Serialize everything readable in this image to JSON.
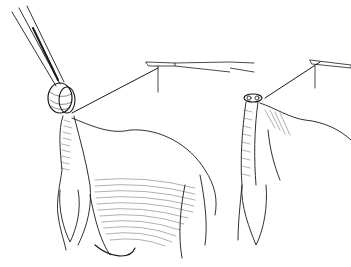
{
  "figure": {
    "type": "surgical line illustration",
    "style": "black ink hatching on white",
    "background": "#ffffff",
    "ink": "#1a1a1a",
    "panels": [
      {
        "id": "left",
        "depicts": [
          "forceps-tips",
          "tissue-loop-knot",
          "suture-thread",
          "clamp-instrument",
          "organ-body",
          "hatched-tissue"
        ]
      },
      {
        "id": "right",
        "depicts": [
          "tied-stump",
          "suture-thread",
          "clamp-instrument",
          "hanging-tissue"
        ]
      }
    ]
  }
}
